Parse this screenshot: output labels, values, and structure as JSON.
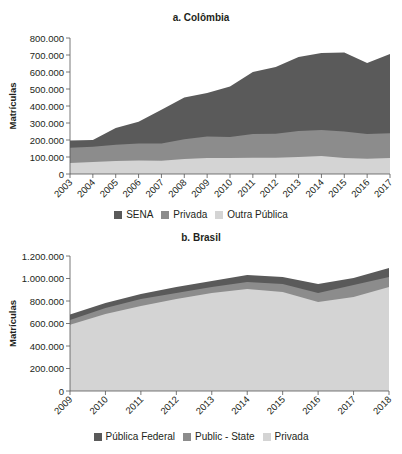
{
  "chart_data": [
    {
      "type": "area",
      "stacked": true,
      "title": "a. Colômbia",
      "xlabel": "",
      "ylabel": "Matrículas",
      "ylim": [
        0,
        800000
      ],
      "yticks": [
        "0",
        "100.000",
        "200.000",
        "300.000",
        "400.000",
        "500.000",
        "600.000",
        "700.000",
        "800.000"
      ],
      "x": [
        "2003",
        "2004",
        "2005",
        "2006",
        "2007",
        "2008",
        "2009",
        "2010",
        "2011",
        "2012",
        "2013",
        "2014",
        "2015",
        "2016",
        "2017"
      ],
      "series": [
        {
          "name": "Outra Pública",
          "color": "#d4d4d4",
          "values": [
            65000,
            70000,
            76000,
            80000,
            78000,
            88000,
            94000,
            94000,
            96000,
            96000,
            100000,
            106000,
            94000,
            90000,
            94000
          ]
        },
        {
          "name": "Privada",
          "color": "#8c8c8c",
          "values": [
            90000,
            90000,
            96000,
            100000,
            102000,
            117000,
            126000,
            124000,
            139000,
            141000,
            153000,
            153000,
            156000,
            145000,
            146000
          ]
        },
        {
          "name": "SENA",
          "color": "#5a5a5a",
          "values": [
            42000,
            40000,
            98000,
            128000,
            198000,
            245000,
            256000,
            297000,
            365000,
            393000,
            435000,
            453000,
            464000,
            418000,
            466000
          ]
        }
      ],
      "legend": [
        "SENA",
        "Privada",
        "Outra Pública"
      ],
      "legend_position": "bottom",
      "grid": false
    },
    {
      "type": "area",
      "stacked": true,
      "title": "b. Brasil",
      "xlabel": "",
      "ylabel": "Matrículas",
      "ylim": [
        0,
        1200000
      ],
      "yticks": [
        "0",
        "200.000",
        "400.000",
        "600.000",
        "800.000",
        "1.000.000",
        "1.200.000"
      ],
      "x": [
        "2009",
        "2010",
        "2011",
        "2012",
        "2013",
        "2014",
        "2015",
        "2016",
        "2017",
        "2018"
      ],
      "series": [
        {
          "name": "Privada",
          "color": "#d4d4d4",
          "values": [
            590000,
            684000,
            756000,
            818000,
            871000,
            907000,
            880000,
            791000,
            836000,
            925000
          ]
        },
        {
          "name": "Public - State",
          "color": "#8c8c8c",
          "values": [
            42000,
            54000,
            62000,
            53000,
            54000,
            62000,
            71000,
            80000,
            106000,
            88000
          ]
        },
        {
          "name": "Pública Federal",
          "color": "#5a5a5a",
          "values": [
            48000,
            44000,
            44000,
            54000,
            53000,
            62000,
            62000,
            80000,
            62000,
            80000
          ]
        }
      ],
      "legend": [
        "Pública Federal",
        "Public - State",
        "Privada"
      ],
      "legend_position": "bottom",
      "grid": false
    }
  ],
  "charts": {
    "colombia": {
      "title": "a. Colômbia",
      "ylabel": "Matrículas",
      "legend": [
        {
          "label": "SENA",
          "color": "#5a5a5a"
        },
        {
          "label": "Privada",
          "color": "#8c8c8c"
        },
        {
          "label": "Outra Pública",
          "color": "#d4d4d4"
        }
      ]
    },
    "brasil": {
      "title": "b. Brasil",
      "ylabel": "Matrículas",
      "legend": [
        {
          "label": "Pública Federal",
          "color": "#5a5a5a"
        },
        {
          "label": "Public - State",
          "color": "#8c8c8c"
        },
        {
          "label": "Privada",
          "color": "#d4d4d4"
        }
      ]
    }
  }
}
